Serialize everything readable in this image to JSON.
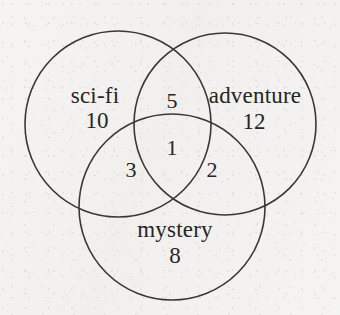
{
  "diagram": {
    "type": "venn",
    "title": "",
    "background_color": "#f2f1ef",
    "stroke_color": "#3a3836",
    "text_color": "#27251f",
    "sets": [
      {
        "key": "sci_fi",
        "label": "sci-fi",
        "only_count": "10",
        "center_x": 118,
        "center_y": 124,
        "radius": 93,
        "label_x": 95,
        "label_y": 98,
        "count_x": 97,
        "count_y": 123
      },
      {
        "key": "adventure",
        "label": "adventure",
        "only_count": "12",
        "center_x": 225,
        "center_y": 124,
        "radius": 91,
        "label_x": 255,
        "label_y": 98,
        "count_x": 254,
        "count_y": 124
      },
      {
        "key": "mystery",
        "label": "mystery",
        "only_count": "8",
        "center_x": 172,
        "center_y": 207,
        "radius": 93,
        "label_x": 175,
        "label_y": 232,
        "count_x": 175,
        "count_y": 258
      }
    ],
    "intersections": [
      {
        "key": "sci_fi_adventure",
        "label": "sci-fi and adventure only",
        "count": "5",
        "x": 172,
        "y": 103
      },
      {
        "key": "sci_fi_mystery",
        "label": "sci-fi and mystery only",
        "count": "3",
        "x": 131,
        "y": 172
      },
      {
        "key": "adventure_mystery",
        "label": "adventure and mystery only",
        "count": "2",
        "x": 212,
        "y": 172
      },
      {
        "key": "all_three",
        "label": "sci-fi, adventure and mystery",
        "count": "1",
        "x": 172,
        "y": 150
      }
    ]
  },
  "chart_data": {
    "type": "venn",
    "title": "",
    "set_labels": [
      "sci-fi",
      "adventure",
      "mystery"
    ],
    "regions": [
      {
        "sets": [
          "sci-fi"
        ],
        "label": "sci-fi only",
        "value": 10
      },
      {
        "sets": [
          "adventure"
        ],
        "label": "adventure only",
        "value": 12
      },
      {
        "sets": [
          "mystery"
        ],
        "label": "mystery only",
        "value": 8
      },
      {
        "sets": [
          "sci-fi",
          "adventure"
        ],
        "label": "sci-fi and adventure only",
        "value": 5
      },
      {
        "sets": [
          "sci-fi",
          "mystery"
        ],
        "label": "sci-fi and mystery only",
        "value": 3
      },
      {
        "sets": [
          "adventure",
          "mystery"
        ],
        "label": "adventure and mystery only",
        "value": 2
      },
      {
        "sets": [
          "sci-fi",
          "adventure",
          "mystery"
        ],
        "label": "all three",
        "value": 1
      }
    ],
    "legend": "none",
    "grid": false
  }
}
